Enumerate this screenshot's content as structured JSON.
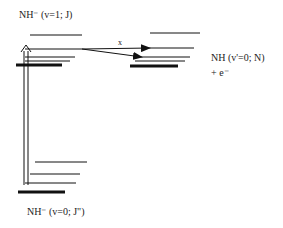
{
  "diagram": {
    "upper_label": "NH⁻ (v=1; J)",
    "right_label": "NH (v'=0; N)",
    "right_sublabel": "+ e⁻",
    "lower_label": "NH⁻ (v=0; J\")",
    "cross_mark": "x",
    "colors": {
      "line": "#111111",
      "background": "#ffffff"
    }
  }
}
